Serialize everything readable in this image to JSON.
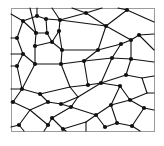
{
  "diagram": {
    "type": "planar-graph",
    "width": 164,
    "height": 146,
    "frame": {
      "x": 11,
      "y": 8,
      "w": 143,
      "h": 123,
      "stroke": "#9a9a9a"
    },
    "colors": {
      "edge": "#111111",
      "node": "#111111",
      "background": "#ffffff"
    },
    "nodes": [
      {
        "id": "a",
        "x": 23,
        "y": 21,
        "dot": true
      },
      {
        "id": "b",
        "x": 37,
        "y": 16,
        "dot": true
      },
      {
        "id": "c",
        "x": 46,
        "y": 19,
        "dot": true
      },
      {
        "id": "d",
        "x": 60,
        "y": 20,
        "dot": true
      },
      {
        "id": "e",
        "x": 86,
        "y": 13,
        "dot": true
      },
      {
        "id": "f",
        "x": 127,
        "y": 10,
        "dot": true
      },
      {
        "id": "g",
        "x": 17,
        "y": 38,
        "dot": true
      },
      {
        "id": "h",
        "x": 36,
        "y": 33,
        "dot": true
      },
      {
        "id": "i",
        "x": 47,
        "y": 33,
        "dot": true
      },
      {
        "id": "j",
        "x": 59,
        "y": 31,
        "dot": true
      },
      {
        "id": "k",
        "x": 106,
        "y": 26,
        "dot": true
      },
      {
        "id": "l",
        "x": 23,
        "y": 54,
        "dot": true
      },
      {
        "id": "m",
        "x": 35,
        "y": 46,
        "dot": true
      },
      {
        "id": "n",
        "x": 52,
        "y": 42,
        "dot": true
      },
      {
        "id": "o",
        "x": 62,
        "y": 50,
        "dot": true
      },
      {
        "id": "p",
        "x": 131,
        "y": 40,
        "dot": true
      },
      {
        "id": "q",
        "x": 139,
        "y": 35,
        "dot": true
      },
      {
        "id": "r",
        "x": 121,
        "y": 44,
        "dot": true
      },
      {
        "id": "s",
        "x": 98,
        "y": 50,
        "dot": true
      },
      {
        "id": "t",
        "x": 84,
        "y": 61,
        "dot": true
      },
      {
        "id": "u",
        "x": 112,
        "y": 58,
        "dot": true
      },
      {
        "id": "v",
        "x": 131,
        "y": 59,
        "dot": true
      },
      {
        "id": "w",
        "x": 17,
        "y": 66,
        "dot": true
      },
      {
        "id": "x",
        "x": 35,
        "y": 64,
        "dot": true
      },
      {
        "id": "y",
        "x": 61,
        "y": 64,
        "dot": true
      },
      {
        "id": "z",
        "x": 88,
        "y": 85,
        "dot": true
      },
      {
        "id": "aa",
        "x": 101,
        "y": 83,
        "dot": true
      },
      {
        "id": "ab",
        "x": 126,
        "y": 75,
        "dot": true
      },
      {
        "id": "ac",
        "x": 120,
        "y": 86,
        "dot": true
      },
      {
        "id": "ad",
        "x": 22,
        "y": 89,
        "dot": true
      },
      {
        "id": "ae",
        "x": 40,
        "y": 94,
        "dot": true
      },
      {
        "id": "af",
        "x": 48,
        "y": 102,
        "dot": true
      },
      {
        "id": "ag",
        "x": 61,
        "y": 104,
        "dot": true
      },
      {
        "id": "ah",
        "x": 13,
        "y": 102,
        "dot": true
      },
      {
        "id": "ai",
        "x": 71,
        "y": 107,
        "dot": true
      },
      {
        "id": "aj",
        "x": 111,
        "y": 105,
        "dot": true
      },
      {
        "id": "ak",
        "x": 130,
        "y": 100,
        "dot": true
      },
      {
        "id": "al",
        "x": 144,
        "y": 108,
        "dot": true
      },
      {
        "id": "am",
        "x": 52,
        "y": 118,
        "dot": true
      },
      {
        "id": "an",
        "x": 96,
        "y": 115,
        "dot": true
      },
      {
        "id": "ao",
        "x": 147,
        "y": 93,
        "dot": false
      },
      {
        "id": "ap",
        "x": 19,
        "y": 125,
        "dot": true
      },
      {
        "id": "aq",
        "x": 48,
        "y": 125,
        "dot": true
      },
      {
        "id": "ar",
        "x": 63,
        "y": 129,
        "dot": true
      },
      {
        "id": "as",
        "x": 105,
        "y": 127,
        "dot": true
      },
      {
        "id": "at",
        "x": 117,
        "y": 123,
        "dot": true
      },
      {
        "id": "au",
        "x": 132,
        "y": 126,
        "dot": true
      },
      {
        "id": "av",
        "x": 70,
        "y": 87,
        "dot": false
      },
      {
        "id": "aw",
        "x": 78,
        "y": 97,
        "dot": false
      },
      {
        "id": "ax",
        "x": 30,
        "y": 110,
        "dot": false
      },
      {
        "id": "ay",
        "x": 86,
        "y": 122,
        "dot": false
      },
      {
        "id": "az",
        "x": 142,
        "y": 78,
        "dot": false
      }
    ],
    "edges": [
      [
        "a",
        11,
        14
      ],
      [
        "a",
        "b"
      ],
      [
        "a",
        "g"
      ],
      [
        "a",
        "h"
      ],
      [
        "b",
        37,
        8
      ],
      [
        "b",
        "c"
      ],
      [
        "c",
        "d"
      ],
      [
        "c",
        "i"
      ],
      [
        "d",
        52,
        8
      ],
      [
        "d",
        "e"
      ],
      [
        "d",
        "j"
      ],
      [
        "d",
        "k"
      ],
      [
        "e",
        72,
        8
      ],
      [
        "e",
        "k"
      ],
      [
        "e",
        102,
        8
      ],
      [
        "f",
        118,
        8
      ],
      [
        "f",
        "k"
      ],
      [
        "f",
        154,
        22
      ],
      [
        "k",
        "p"
      ],
      [
        "k",
        "s"
      ],
      [
        "g",
        11,
        38
      ],
      [
        "g",
        "l"
      ],
      [
        "h",
        "i"
      ],
      [
        "h",
        "m"
      ],
      [
        "h",
        30,
        8
      ],
      [
        "i",
        "n"
      ],
      [
        "j",
        "n"
      ],
      [
        "j",
        "o"
      ],
      [
        "n",
        "o"
      ],
      [
        "n",
        "m"
      ],
      [
        "o",
        "s"
      ],
      [
        "o",
        "y"
      ],
      [
        "m",
        "x"
      ],
      [
        "l",
        11,
        54
      ],
      [
        "l",
        "x"
      ],
      [
        "l",
        "w"
      ],
      [
        "p",
        "q"
      ],
      [
        "p",
        "r"
      ],
      [
        "p",
        "v"
      ],
      [
        "q",
        154,
        34
      ],
      [
        "q",
        154,
        50
      ],
      [
        "r",
        "s"
      ],
      [
        "r",
        "u"
      ],
      [
        "s",
        "t"
      ],
      [
        "t",
        "y"
      ],
      [
        "t",
        "u"
      ],
      [
        "t",
        "z"
      ],
      [
        "u",
        "v"
      ],
      [
        "u",
        "aa"
      ],
      [
        "v",
        "ab"
      ],
      [
        "v",
        154,
        62
      ],
      [
        "w",
        11,
        66
      ],
      [
        "w",
        "ad"
      ],
      [
        "x",
        "y"
      ],
      [
        "x",
        "ad"
      ],
      [
        "y",
        "av"
      ],
      [
        "av",
        "z"
      ],
      [
        "av",
        "ae"
      ],
      [
        "av",
        "aw"
      ],
      [
        "z",
        "aa"
      ],
      [
        "aa",
        "ab"
      ],
      [
        "aa",
        "ac"
      ],
      [
        "ab",
        "az"
      ],
      [
        "az",
        154,
        76
      ],
      [
        "az",
        "ao"
      ],
      [
        "ac",
        "ak"
      ],
      [
        "ac",
        "aj"
      ],
      [
        "ad",
        "ae"
      ],
      [
        "ad",
        11,
        89
      ],
      [
        "ad",
        "ah"
      ],
      [
        "ae",
        "af"
      ],
      [
        "af",
        "ag"
      ],
      [
        "af",
        "ax"
      ],
      [
        "ag",
        "ai"
      ],
      [
        "ag",
        "aw"
      ],
      [
        "ai",
        "aw"
      ],
      [
        "ai",
        "an"
      ],
      [
        "ai",
        "am"
      ],
      [
        "ah",
        "ax"
      ],
      [
        "ah",
        11,
        102
      ],
      [
        "ax",
        "ap"
      ],
      [
        "ax",
        "aq"
      ],
      [
        "aw",
        "aa"
      ],
      [
        "aj",
        "an"
      ],
      [
        "aj",
        "ak"
      ],
      [
        "aj",
        "at"
      ],
      [
        "ak",
        "ao"
      ],
      [
        "ak",
        "al"
      ],
      [
        "ao",
        154,
        93
      ],
      [
        "al",
        154,
        110
      ],
      [
        "al",
        "au"
      ],
      [
        "am",
        "aq"
      ],
      [
        "am",
        "ar"
      ],
      [
        "an",
        "ay"
      ],
      [
        "an",
        "as"
      ],
      [
        "ay",
        "ar"
      ],
      [
        "ay",
        86,
        131
      ],
      [
        "as",
        "at"
      ],
      [
        "at",
        "au"
      ],
      [
        "au",
        140,
        131
      ],
      [
        "ap",
        11,
        127
      ],
      [
        "ap",
        24,
        131
      ],
      [
        "aq",
        44,
        131
      ],
      [
        "ar",
        66,
        131
      ]
    ]
  }
}
